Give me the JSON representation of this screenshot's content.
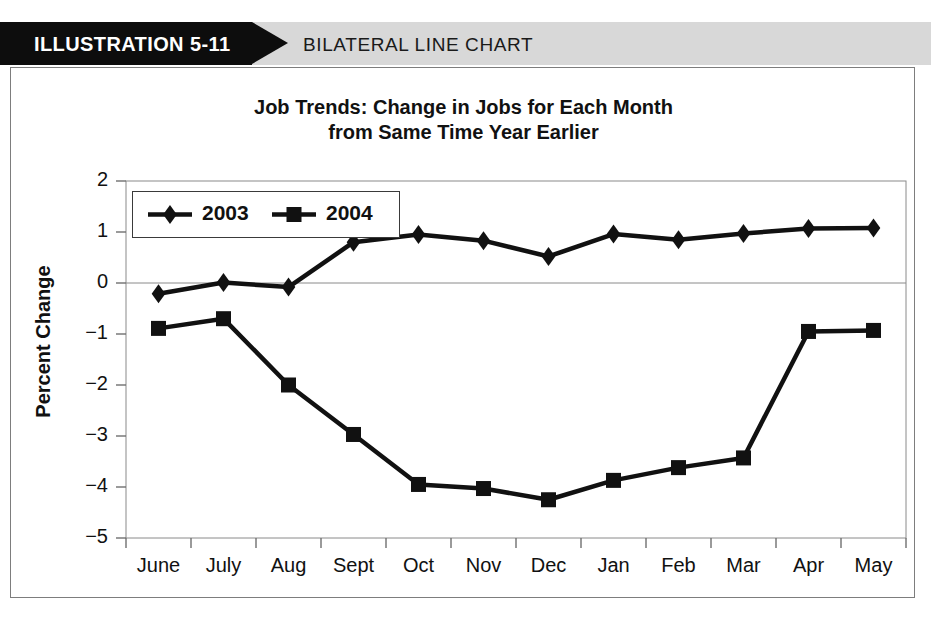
{
  "banner": {
    "label": "ILLUSTRATION 5-11",
    "subtitle": "BILATERAL LINE CHART"
  },
  "chart_data": {
    "type": "line",
    "title": "Job Trends: Change in Jobs for Each Month from Same Time Year Earlier",
    "title_lines": [
      "Job Trends: Change in Jobs for Each Month",
      "from Same Time Year Earlier"
    ],
    "xlabel": "",
    "ylabel": "Percent Change",
    "categories": [
      "June",
      "July",
      "Aug",
      "Sept",
      "Oct",
      "Nov",
      "Dec",
      "Jan",
      "Feb",
      "Mar",
      "Apr",
      "May"
    ],
    "ylim": [
      -5,
      2
    ],
    "yticks": [
      2,
      1,
      0,
      -1,
      -2,
      -3,
      -4,
      -5
    ],
    "ytick_labels": [
      "2",
      "1",
      "0",
      "−1",
      "−2",
      "−3",
      "−4",
      "−5"
    ],
    "grid": false,
    "zero_line": true,
    "legend_position": "top-left",
    "series": [
      {
        "name": "2003",
        "marker": "diamond",
        "color": "#111111",
        "values": [
          -0.21,
          0.01,
          -0.08,
          0.8,
          0.95,
          0.83,
          0.52,
          0.96,
          0.85,
          0.97,
          1.07,
          1.08
        ]
      },
      {
        "name": "2004",
        "marker": "square",
        "color": "#111111",
        "values": [
          -0.89,
          -0.7,
          -2.0,
          -2.97,
          -3.95,
          -4.03,
          -4.25,
          -3.87,
          -3.62,
          -3.43,
          -0.95,
          -0.93
        ]
      }
    ]
  }
}
